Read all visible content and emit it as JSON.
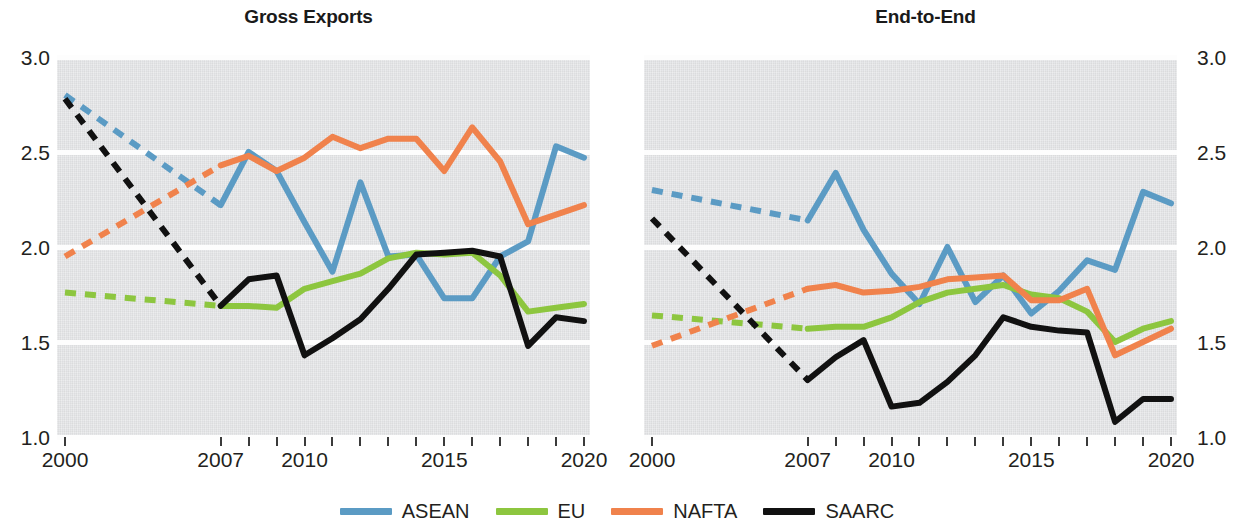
{
  "chart_data": {
    "type": "line",
    "title": "",
    "panels": [
      {
        "title": "Gross Exports",
        "xlabel": "",
        "ylabel": "",
        "ylim": [
          1.0,
          3.0
        ],
        "yticks": [
          1.0,
          1.5,
          2.0,
          2.5,
          3.0
        ],
        "ytick_labels": [
          "1.0",
          "1.5",
          "2.0",
          "2.5",
          "3.0"
        ],
        "y_axis_side": "left",
        "x": [
          2000,
          2007,
          2008,
          2009,
          2010,
          2011,
          2012,
          2013,
          2014,
          2015,
          2016,
          2017,
          2018,
          2019,
          2020
        ],
        "xtick_labels": [
          "2000",
          "2007",
          "2010",
          "2015",
          "2020"
        ],
        "xtick_label_values": [
          2000,
          2007,
          2010,
          2015,
          2020
        ],
        "dashed_segment": [
          2000,
          2007
        ],
        "series": [
          {
            "name": "ASEAN",
            "color": "#5B9BC4",
            "values": [
              2.8,
              2.22,
              2.5,
              2.4,
              2.13,
              1.87,
              2.34,
              1.95,
              1.96,
              1.73,
              1.73,
              1.95,
              2.03,
              2.53,
              2.47
            ]
          },
          {
            "name": "EU",
            "color": "#8DC63F",
            "values": [
              1.76,
              1.69,
              1.69,
              1.68,
              1.78,
              1.82,
              1.86,
              1.94,
              1.97,
              1.96,
              1.97,
              1.85,
              1.66,
              1.68,
              1.7
            ]
          },
          {
            "name": "NAFTA",
            "color": "#F0824C",
            "values": [
              1.95,
              2.43,
              2.48,
              2.4,
              2.47,
              2.58,
              2.52,
              2.57,
              2.57,
              2.4,
              2.63,
              2.45,
              2.12,
              2.17,
              2.22
            ]
          },
          {
            "name": "SAARC",
            "color": "#111111",
            "values": [
              2.78,
              1.69,
              1.83,
              1.85,
              1.43,
              1.52,
              1.62,
              1.78,
              1.96,
              1.97,
              1.98,
              1.95,
              1.48,
              1.63,
              1.61
            ]
          }
        ]
      },
      {
        "title": "End-to-End",
        "xlabel": "",
        "ylabel": "",
        "ylim": [
          1.0,
          3.0
        ],
        "yticks": [
          1.0,
          1.5,
          2.0,
          2.5,
          3.0
        ],
        "ytick_labels": [
          "1.0",
          "1.5",
          "2.0",
          "2.5",
          "3.0"
        ],
        "y_axis_side": "right",
        "x": [
          2000,
          2007,
          2008,
          2009,
          2010,
          2011,
          2012,
          2013,
          2014,
          2015,
          2016,
          2017,
          2018,
          2019,
          2020
        ],
        "xtick_labels": [
          "2000",
          "2007",
          "2010",
          "2015",
          "2020"
        ],
        "xtick_label_values": [
          2000,
          2007,
          2010,
          2015,
          2020
        ],
        "dashed_segment": [
          2000,
          2007
        ],
        "series": [
          {
            "name": "ASEAN",
            "color": "#5B9BC4",
            "values": [
              2.3,
              2.14,
              2.39,
              2.09,
              1.86,
              1.7,
              2.0,
              1.71,
              1.85,
              1.65,
              1.77,
              1.93,
              1.88,
              2.29,
              2.23
            ]
          },
          {
            "name": "EU",
            "color": "#8DC63F",
            "values": [
              1.64,
              1.57,
              1.58,
              1.58,
              1.63,
              1.71,
              1.76,
              1.78,
              1.8,
              1.75,
              1.73,
              1.66,
              1.5,
              1.57,
              1.61
            ]
          },
          {
            "name": "NAFTA",
            "color": "#F0824C",
            "values": [
              1.48,
              1.78,
              1.8,
              1.76,
              1.77,
              1.79,
              1.83,
              1.84,
              1.85,
              1.72,
              1.72,
              1.78,
              1.43,
              1.5,
              1.57
            ]
          },
          {
            "name": "SAARC",
            "color": "#111111",
            "values": [
              2.15,
              1.3,
              1.42,
              1.51,
              1.16,
              1.18,
              1.29,
              1.43,
              1.63,
              1.58,
              1.56,
              1.55,
              1.08,
              1.2,
              1.2
            ]
          }
        ]
      }
    ],
    "legend": {
      "position": "bottom-center",
      "entries": [
        {
          "label": "ASEAN",
          "color": "#5B9BC4"
        },
        {
          "label": "EU",
          "color": "#8DC63F"
        },
        {
          "label": "NAFTA",
          "color": "#F0824C"
        },
        {
          "label": "SAARC",
          "color": "#111111"
        }
      ]
    },
    "grid": {
      "horizontal": true,
      "vertical": false,
      "color": "#fdfdfd"
    },
    "plot_background": "#e3e4e6"
  }
}
